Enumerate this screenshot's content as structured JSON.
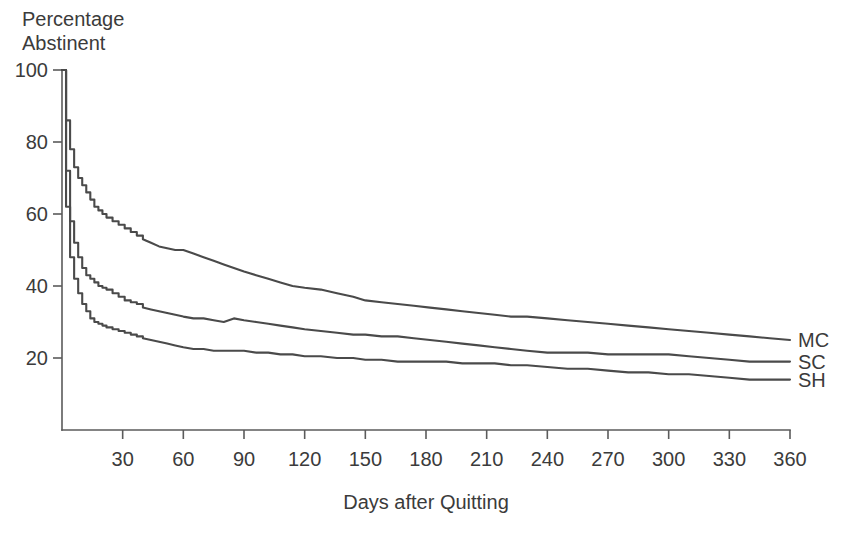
{
  "chart_data": {
    "type": "line",
    "title": "",
    "subtitle": "",
    "xlabel": "Days after Quitting",
    "ylabel": "Percentage Abstinent",
    "ylabel_line1": "Percentage",
    "ylabel_line2": "Abstinent",
    "xlim": [
      0,
      360
    ],
    "ylim": [
      0,
      100
    ],
    "xticks": [
      30,
      60,
      90,
      120,
      150,
      180,
      210,
      240,
      270,
      300,
      330,
      360
    ],
    "yticks": [
      20,
      40,
      60,
      80,
      100
    ],
    "grid": false,
    "legend_position": "right-inline",
    "line_color": "#4a4a4a",
    "axis_color": "#5b5b5b",
    "background": "#ffffff",
    "x": [
      0,
      2,
      4,
      6,
      8,
      10,
      12,
      14,
      16,
      18,
      20,
      22,
      25,
      28,
      31,
      34,
      37,
      40,
      44,
      48,
      52,
      56,
      60,
      65,
      70,
      75,
      80,
      85,
      90,
      96,
      102,
      108,
      114,
      120,
      128,
      136,
      144,
      150,
      158,
      166,
      174,
      182,
      190,
      198,
      206,
      214,
      222,
      230,
      240,
      250,
      260,
      270,
      280,
      290,
      300,
      310,
      320,
      330,
      340,
      350,
      360
    ],
    "series": [
      {
        "name": "MC",
        "label": "MC",
        "description": "Multiple component treatment",
        "values": [
          100,
          86,
          78,
          73,
          70,
          68,
          66,
          64,
          62,
          61,
          60,
          59,
          58,
          57,
          56,
          55,
          54,
          53,
          52,
          51,
          50.5,
          50,
          50,
          49,
          48,
          47,
          46,
          45,
          44,
          43,
          42,
          41,
          40,
          39.5,
          39,
          38,
          37,
          36,
          35.5,
          35,
          34.5,
          34,
          33.5,
          33,
          32.5,
          32,
          31.5,
          31.5,
          31,
          30.5,
          30,
          29.5,
          29,
          28.5,
          28,
          27.5,
          27,
          26.5,
          26,
          25.5,
          25
        ]
      },
      {
        "name": "SC",
        "label": "SC",
        "description": "Standard counseling",
        "values": [
          100,
          72,
          58,
          52,
          48,
          45,
          43,
          42,
          41,
          40,
          39.5,
          39,
          38,
          37,
          36,
          35.5,
          35,
          34,
          33.5,
          33,
          32.5,
          32,
          31.5,
          31,
          31,
          30.5,
          30,
          31,
          30.5,
          30,
          29.5,
          29,
          28.5,
          28,
          27.5,
          27,
          26.5,
          26.5,
          26,
          26,
          25.5,
          25,
          24.5,
          24,
          23.5,
          23,
          22.5,
          22,
          21.5,
          21.5,
          21.5,
          21,
          21,
          21,
          21,
          20.5,
          20,
          19.5,
          19,
          19,
          19
        ]
      },
      {
        "name": "SH",
        "label": "SH",
        "description": "Self help",
        "values": [
          100,
          62,
          48,
          42,
          38,
          35,
          33,
          31,
          30,
          29.5,
          29,
          28.5,
          28,
          27.5,
          27,
          26.5,
          26,
          25.5,
          25,
          24.5,
          24,
          23.5,
          23,
          22.5,
          22.5,
          22,
          22,
          22,
          22,
          21.5,
          21.5,
          21,
          21,
          20.5,
          20.5,
          20,
          20,
          19.5,
          19.5,
          19,
          19,
          19,
          19,
          18.5,
          18.5,
          18.5,
          18,
          18,
          17.5,
          17,
          17,
          16.5,
          16,
          16,
          15.5,
          15.5,
          15,
          14.5,
          14,
          14,
          14
        ]
      }
    ]
  },
  "axes": {
    "x_title": "Days after Quitting",
    "y_title_line1": "Percentage",
    "y_title_line2": "Abstinent"
  }
}
